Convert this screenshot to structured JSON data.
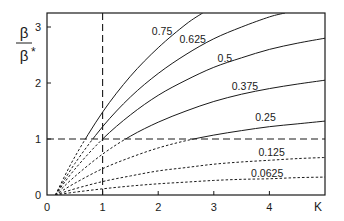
{
  "chart_data": {
    "type": "line",
    "title": "",
    "xlabel": "K",
    "ylabel": "β/β*",
    "ylabel_num": "β",
    "ylabel_den": "β",
    "ylabel_den_sup": "*",
    "xlim": [
      0,
      5
    ],
    "ylim": [
      0,
      3.25
    ],
    "x_ticks": [
      0,
      1,
      2,
      3,
      4
    ],
    "y_ticks": [
      0,
      1,
      2,
      3
    ],
    "grid": false,
    "legend": "none (curves labeled inline)",
    "line_style_rule": "solid where value >= 1, dashed where value < 1",
    "style_threshold": 1,
    "reference_lines": [
      {
        "axis": "y",
        "value": 1,
        "style": "dashed"
      },
      {
        "axis": "x",
        "value": 1,
        "style": "dashed"
      }
    ],
    "series": [
      {
        "name": "0.75",
        "x": [
          0.15,
          0.5,
          1,
          1.5,
          2,
          2.5,
          2.8
        ],
        "y": [
          0,
          0.68,
          1.48,
          2.12,
          2.63,
          3.05,
          3.25
        ],
        "label_at": [
          2.07,
          2.93
        ]
      },
      {
        "name": "0.625",
        "x": [
          0.15,
          0.5,
          1,
          1.5,
          2,
          2.5,
          3,
          3.5,
          4,
          4.28
        ],
        "y": [
          0,
          0.56,
          1.22,
          1.75,
          2.17,
          2.51,
          2.79,
          3.0,
          3.18,
          3.25
        ],
        "label_at": [
          2.62,
          2.78
        ]
      },
      {
        "name": "0.5",
        "x": [
          0.15,
          0.5,
          1,
          1.5,
          2,
          2.5,
          3,
          3.5,
          4,
          4.5,
          5
        ],
        "y": [
          0,
          0.46,
          1.0,
          1.43,
          1.78,
          2.05,
          2.28,
          2.45,
          2.6,
          2.71,
          2.8
        ],
        "label_at": [
          3.2,
          2.44
        ]
      },
      {
        "name": "0.375",
        "x": [
          0.15,
          0.5,
          1,
          1.5,
          2,
          2.5,
          3,
          3.5,
          4,
          4.5,
          5
        ],
        "y": [
          0,
          0.33,
          0.73,
          1.05,
          1.3,
          1.5,
          1.67,
          1.8,
          1.9,
          1.98,
          2.05
        ],
        "label_at": [
          3.56,
          1.95
        ]
      },
      {
        "name": "0.25",
        "x": [
          0.15,
          0.5,
          1,
          1.5,
          2,
          2.5,
          3,
          3.5,
          4,
          4.5,
          5
        ],
        "y": [
          0,
          0.21,
          0.47,
          0.67,
          0.84,
          0.97,
          1.07,
          1.15,
          1.22,
          1.27,
          1.32
        ],
        "label_at": [
          3.93,
          1.4
        ]
      },
      {
        "name": "0.125",
        "x": [
          0.15,
          0.5,
          1,
          1.5,
          2,
          2.5,
          3,
          3.5,
          4,
          4.5,
          5
        ],
        "y": [
          0,
          0.11,
          0.24,
          0.34,
          0.43,
          0.49,
          0.55,
          0.59,
          0.62,
          0.65,
          0.67
        ],
        "label_at": [
          4.04,
          0.76
        ]
      },
      {
        "name": "0.0625",
        "x": [
          0.15,
          0.5,
          1,
          1.5,
          2,
          2.5,
          3,
          3.5,
          4,
          4.5,
          5
        ],
        "y": [
          0,
          0.05,
          0.11,
          0.16,
          0.2,
          0.23,
          0.26,
          0.28,
          0.29,
          0.31,
          0.32
        ],
        "label_at": [
          3.96,
          0.39
        ]
      }
    ]
  }
}
